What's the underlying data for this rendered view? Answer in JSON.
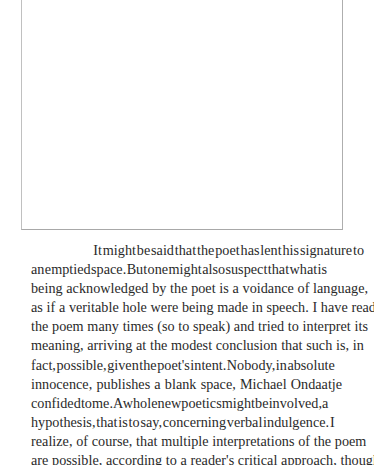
{
  "page": {
    "background_color": "#ffffff",
    "text_color": "#2a2a2a",
    "frame_border_color": "#b9b9b9"
  },
  "blank_space_figure": {
    "label": "blank poem frame",
    "caption": ""
  },
  "body": {
    "paragraph": "It might be said that the poet has lent his signature to an emptied space. But one might also suspect that what is being acknowledged by the poet is a voidance of language, as if a veritable hole were being made in speech. I have read the poem many times (so to speak) and tried to interpret its meaning, arriving at the modest conclusion that such is, in fact, possible, given the poet's intent. Nobody, in absolute innocence, publishes a blank space, Michael Ondaatje confided to me. A whole new poetics might be involved, a hypothesis, that is to say, concerning verbal indulgence. I realize, of course, that multiple interpretations of the poem are possible, according to a reader's critical approach, though",
    "lines": [
      "It might be said that the poet has lent his signature to",
      "an emptied space. But one might also suspect that what is",
      "being acknowledged by the poet is a voidance of language,",
      "as if a veritable hole were being made in speech. I have read",
      "the poem many times (so to speak) and tried to interpret its",
      "meaning, arriving at the modest conclusion that such is, in",
      "fact, possible, given the poet's intent. Nobody, in absolute",
      "innocence, publishes a blank space, Michael Ondaatje",
      "confided to me. A whole new poetics might be involved, a",
      "hypothesis, that is to say, concerning verbal indulgence. I",
      "realize, of course, that multiple interpretations of the poem",
      "are possible, according to a reader's critical approach, though"
    ]
  }
}
